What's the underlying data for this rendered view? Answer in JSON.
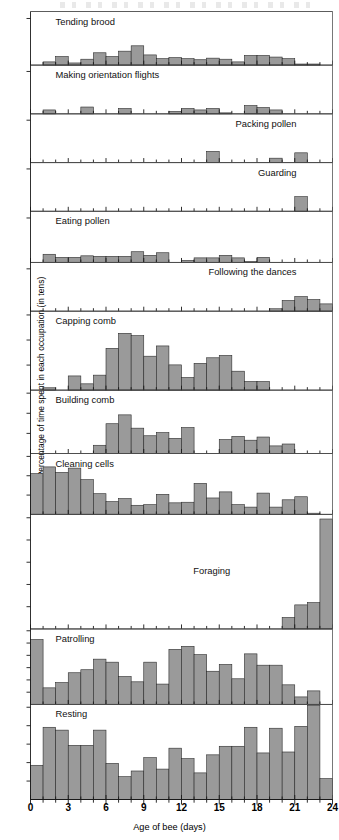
{
  "figure": {
    "xlabel": "Age of bee (days)",
    "ylabel": "Percentage of time spent in each occupation (in tens)",
    "bar_color": "#9a9a9a",
    "bar_edge_color": "#2b2b2b",
    "axis_color": "#1a1a1a"
  },
  "chart_data": {
    "type": "bar",
    "title": "",
    "subtitle": "",
    "xlabel": "Age of bee (days)",
    "ylabel": "Percentage of time spent in each occupation (in tens)",
    "xlim": [
      0,
      24
    ],
    "xtick_labels": [
      "0",
      "3",
      "6",
      "9",
      "12",
      "15",
      "18",
      "21",
      "24"
    ],
    "xticks": [
      0,
      3,
      6,
      9,
      12,
      15,
      18,
      21,
      24
    ],
    "grid": false,
    "legend": "none",
    "layout": "12 stacked panels sharing one x axis; each panel is a histogram of one occupation",
    "bin_width_days": 1,
    "categories": [
      0,
      1,
      2,
      3,
      4,
      5,
      6,
      7,
      8,
      9,
      10,
      11,
      12,
      13,
      14,
      15,
      16,
      17,
      18,
      19,
      20,
      21,
      22,
      23
    ],
    "panels": [
      {
        "label": "Tending brood",
        "ylim": [
          0,
          10
        ],
        "ytick_count": 1,
        "values": [
          0,
          0.6,
          1.6,
          0.4,
          1.1,
          2.3,
          1.6,
          2.6,
          3.6,
          1.9,
          1.2,
          1.4,
          1.2,
          1.0,
          1.3,
          1.1,
          0.6,
          1.8,
          1.8,
          1.5,
          1.2,
          0.2,
          0.2,
          0
        ]
      },
      {
        "label": "Making orientation flights",
        "ylim": [
          0,
          10
        ],
        "ytick_count": 1,
        "values": [
          0,
          0.8,
          0,
          0,
          1.4,
          0,
          0,
          1.1,
          0,
          0,
          0,
          0.5,
          1.1,
          0.8,
          1.1,
          0.2,
          0,
          1.7,
          1.3,
          0.8,
          0,
          0,
          0,
          0
        ]
      },
      {
        "label": "Packing pollen",
        "ylim": [
          0,
          10
        ],
        "ytick_count": 1,
        "values": [
          0,
          0,
          0,
          0,
          0,
          0,
          0,
          0,
          0,
          0,
          0,
          0,
          0,
          0,
          2.3,
          0,
          0,
          0,
          0,
          0.9,
          0,
          2.0,
          0,
          0
        ]
      },
      {
        "label": "Guarding",
        "ylim": [
          0,
          10
        ],
        "ytick_count": 1,
        "values": [
          0,
          0,
          0,
          0,
          0,
          0,
          0,
          0,
          0,
          0,
          0,
          0,
          0,
          0,
          0,
          0,
          0,
          0,
          0,
          0,
          0,
          3.0,
          0,
          0
        ]
      },
      {
        "label": "Eating pollen",
        "ylim": [
          0,
          10
        ],
        "ytick_count": 1,
        "values": [
          0,
          1.6,
          1.0,
          1.0,
          1.3,
          1.2,
          1.2,
          1.2,
          2.1,
          1.4,
          1.9,
          0,
          0.4,
          0.9,
          0.9,
          1.4,
          0.9,
          0.2,
          1.0,
          0,
          0,
          0,
          0,
          0
        ]
      },
      {
        "label": "Following the dances",
        "ylim": [
          0,
          10
        ],
        "ytick_count": 1,
        "values": [
          0,
          0,
          0,
          0,
          0,
          0,
          0,
          0,
          0,
          0,
          0,
          0,
          0,
          0,
          0,
          0,
          0,
          0,
          0,
          0.5,
          2.2,
          3.0,
          2.4,
          1.5
        ]
      },
      {
        "label": "Capping comb",
        "ylim": [
          0,
          10
        ],
        "ytick_count": 3,
        "values": [
          0,
          0.3,
          0,
          1.8,
          0.8,
          1.9,
          5.3,
          7.2,
          6.9,
          4.3,
          5.6,
          3.2,
          1.6,
          3.4,
          4.1,
          4.4,
          2.4,
          1.1,
          1.1,
          0,
          0,
          0,
          0,
          0
        ]
      },
      {
        "label": "Building comb",
        "ylim": [
          0,
          10
        ],
        "ytick_count": 3,
        "values": [
          0,
          0,
          0,
          0,
          0,
          1.3,
          4.7,
          6.1,
          4.0,
          2.8,
          3.3,
          2.4,
          4.1,
          0,
          0,
          2.2,
          2.7,
          2.1,
          2.6,
          1.2,
          1.5,
          0,
          0,
          0
        ]
      },
      {
        "label": "Cleaning cells",
        "ylim": [
          0,
          10
        ],
        "ytick_count": 3,
        "values": [
          6.7,
          7.8,
          6.9,
          7.6,
          5.7,
          3.4,
          2.1,
          2.6,
          1.5,
          1.6,
          3.3,
          1.9,
          2.0,
          5.1,
          2.7,
          3.7,
          1.6,
          1.2,
          3.5,
          1.2,
          2.4,
          2.9,
          0.2,
          0
        ]
      },
      {
        "label": "Foraging",
        "ylim": [
          0,
          10
        ],
        "ytick_count": 5,
        "values": [
          0,
          0,
          0,
          0,
          0,
          0,
          0,
          0,
          0,
          0,
          0,
          0,
          0,
          0,
          0,
          0,
          0,
          0,
          0,
          0,
          1.0,
          2.1,
          2.3,
          9.6
        ]
      },
      {
        "label": "Patrolling",
        "ylim": [
          0,
          10
        ],
        "ytick_count": 6,
        "values": [
          8.6,
          2.2,
          2.9,
          4.2,
          4.6,
          6.0,
          5.6,
          3.7,
          3.0,
          5.6,
          2.7,
          7.3,
          7.7,
          6.6,
          4.4,
          5.3,
          3.4,
          6.7,
          5.2,
          5.2,
          2.6,
          1.0,
          1.8,
          0
        ]
      },
      {
        "label": "Resting",
        "ylim": [
          0,
          10
        ],
        "ytick_count": 5,
        "values": [
          3.6,
          7.6,
          7.3,
          5.7,
          5.7,
          7.3,
          3.8,
          2.4,
          3.0,
          4.4,
          3.2,
          5.4,
          4.3,
          2.8,
          4.7,
          5.6,
          5.6,
          7.6,
          4.9,
          7.5,
          5.0,
          7.7,
          9.9,
          2.2
        ]
      }
    ]
  }
}
